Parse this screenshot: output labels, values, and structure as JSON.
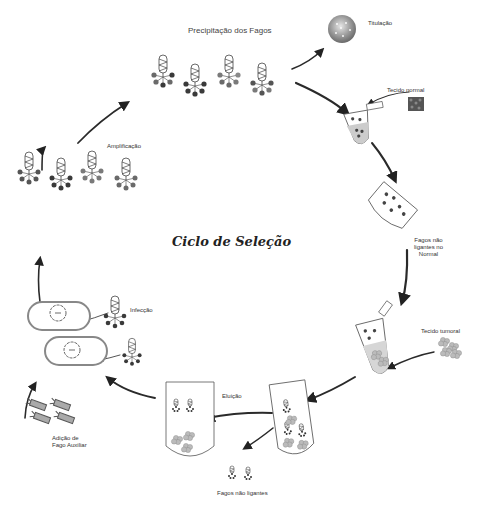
{
  "diagram": {
    "title": "Ciclo de Seleção",
    "steps": {
      "precipitation": "Precipitação dos Fagos",
      "titration": "Titulação",
      "normal_tissue": "Tecido normal",
      "non_binding_normal": [
        "Fagos não",
        "ligantes no",
        "Normal"
      ],
      "tumor_tissue": "Tecido tumoral",
      "elution": "Eluição",
      "non_binding": "Fagos não ligantes",
      "helper_phage": [
        "Adição de",
        "Fago Auxiliar"
      ],
      "infection": "Infecção",
      "amplification": "Amplificação"
    },
    "colors": {
      "arrow": "#333333",
      "phage_dark": "#3a3a3a",
      "phage_mid": "#6a6a6a",
      "phage_light": "#8a8a8a",
      "tube_fill": "#d6d6d6",
      "titration_sphere": "#9a9a9a"
    }
  }
}
